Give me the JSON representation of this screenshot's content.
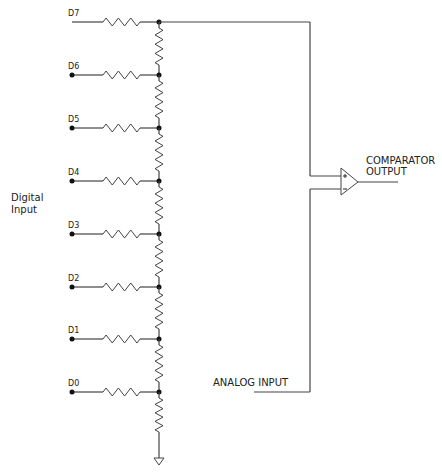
{
  "diagram": {
    "type": "R-2R ladder DAC with comparator",
    "left_label": [
      "Digital",
      "Input"
    ],
    "inputs": [
      {
        "label": "D7",
        "y": 22,
        "dot": false
      },
      {
        "label": "D6",
        "y": 75,
        "dot": true
      },
      {
        "label": "D5",
        "y": 128,
        "dot": true
      },
      {
        "label": "D4",
        "y": 181,
        "dot": true
      },
      {
        "label": "D3",
        "y": 234,
        "dot": true
      },
      {
        "label": "D2",
        "y": 287,
        "dot": true
      },
      {
        "label": "D1",
        "y": 339,
        "dot": true
      },
      {
        "label": "D0",
        "y": 392,
        "dot": true
      }
    ],
    "comparator": {
      "label_line1": "COMPARATOR",
      "label_line2": "OUTPUT",
      "plus": "+",
      "minus": "−"
    },
    "analog_input": {
      "label": "ANALOG INPUT"
    },
    "ground": "ground-symbol",
    "colors": {
      "wire": "#444444",
      "text": "#222222",
      "background": "#ffffff"
    }
  }
}
